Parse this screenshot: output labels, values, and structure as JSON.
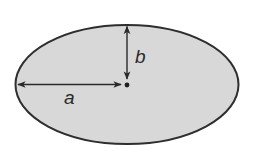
{
  "diagram": {
    "ellipse": {
      "cx": 127,
      "cy": 84.5,
      "rx": 111.5,
      "ry": 59.5,
      "fill": "#d8d8d8",
      "stroke": "#2e2e2e"
    },
    "center_point": {
      "x": 127,
      "y": 85
    },
    "semi_major_axis": {
      "label": "a",
      "from": [
        17,
        84
      ],
      "to": [
        121,
        84
      ]
    },
    "semi_minor_axis": {
      "label": "b",
      "from": [
        127,
        26
      ],
      "to": [
        127,
        79
      ]
    },
    "colors": {
      "background": "#ffffff",
      "fill": "#d8d8d8",
      "stroke": "#2e2e2e",
      "arrow": "#2a2a2a"
    }
  }
}
